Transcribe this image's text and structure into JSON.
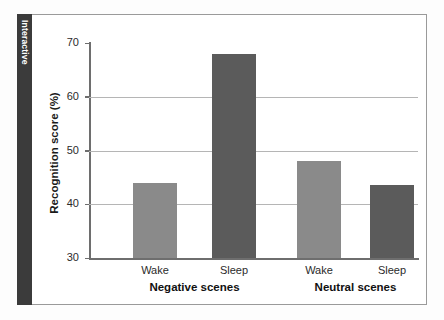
{
  "sidebar": {
    "tab_label": "Interactive"
  },
  "chart_data": {
    "type": "bar",
    "title": "",
    "xlabel": "",
    "ylabel": "Recognition score (%)",
    "ylim": [
      30,
      70
    ],
    "yticks": [
      30,
      40,
      50,
      60,
      70
    ],
    "gridlines": [
      40,
      50,
      60
    ],
    "grid": true,
    "legend": "none",
    "categories": [
      "Wake",
      "Sleep",
      "Wake",
      "Sleep"
    ],
    "groups": [
      {
        "label": "Negative scenes",
        "categories": [
          "Wake",
          "Sleep"
        ],
        "values": [
          44,
          68
        ]
      },
      {
        "label": "Neutral scenes",
        "categories": [
          "Wake",
          "Sleep"
        ],
        "values": [
          48,
          43.5
        ]
      }
    ],
    "values": [
      44,
      68,
      48,
      43.5
    ],
    "bar_colors": [
      "#8a8a8a",
      "#5b5b5b",
      "#8a8a8a",
      "#5b5b5b"
    ],
    "colors": {
      "wake": "#8a8a8a",
      "sleep": "#5b5b5b",
      "axis": "#6e6e6e",
      "grid": "#b5b5b5",
      "tab": "#3b3b3b"
    }
  }
}
